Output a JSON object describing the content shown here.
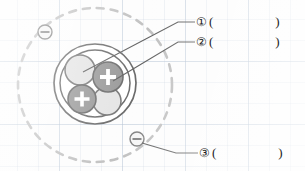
{
  "diagram": {
    "background": {
      "paper_color": "#fcfcfc",
      "grid_color": "#96aac3"
    },
    "orbit": {
      "name": "electron-orbit",
      "style": "dashed",
      "color": "#a6a6a6",
      "cx": 95,
      "cy": 85,
      "r": 77
    },
    "nucleus": {
      "name": "nucleus",
      "outline_color": "#2b2b2b",
      "fill_color": "#ffffff",
      "cx": 95,
      "cy": 84,
      "r": 40
    },
    "nucleons": [
      {
        "id": "neutron-top-left",
        "type": "neutron",
        "charge_symbol": "",
        "color": "#d9d9d9",
        "cx": 80,
        "cy": 70,
        "r": 15
      },
      {
        "id": "proton-top-right",
        "type": "proton",
        "charge_symbol": "+",
        "color": "#6d6d6d",
        "cx": 108,
        "cy": 77,
        "r": 15
      },
      {
        "id": "proton-bottom-left",
        "type": "proton",
        "charge_symbol": "+",
        "color": "#6d6d6d",
        "cx": 82,
        "cy": 99,
        "r": 14
      },
      {
        "id": "neutron-bottom-right",
        "type": "neutron",
        "charge_symbol": "",
        "color": "#d9d9d9",
        "cx": 107,
        "cy": 101,
        "r": 14
      }
    ],
    "electrons": [
      {
        "id": "electron-upper-left",
        "charge_symbol": "−",
        "cx": 45,
        "cy": 32,
        "r": 7
      },
      {
        "id": "electron-lower-right",
        "charge_symbol": "−",
        "cx": 137,
        "cy": 139,
        "r": 7
      }
    ],
    "leader_lines": [
      {
        "id": "leader-1",
        "from": [
          83,
          72
        ],
        "to": [
          195,
          22
        ],
        "target": "neutron-top-left"
      },
      {
        "id": "leader-2",
        "from": [
          112,
          80
        ],
        "to": [
          195,
          42
        ],
        "target": "proton-top-right"
      },
      {
        "id": "leader-3",
        "from": [
          142,
          143
        ],
        "to": [
          198,
          152
        ],
        "target": "electron-lower-right"
      }
    ]
  },
  "labels": [
    {
      "marker": "①",
      "open": "(",
      "close": ")",
      "answer": ""
    },
    {
      "marker": "②",
      "open": "(",
      "close": ")",
      "answer": ""
    },
    {
      "marker": "③",
      "open": "(",
      "close": ")",
      "answer": ""
    }
  ]
}
